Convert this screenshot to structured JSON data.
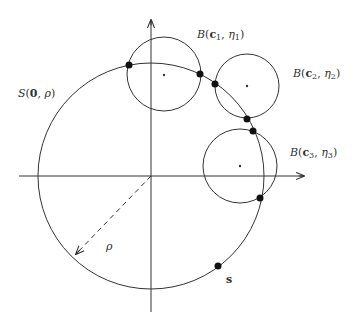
{
  "figure": {
    "labels": {
      "big_sphere": {
        "S": "S",
        "open": "(",
        "center": "0",
        "sep": ", ",
        "radius": "ρ",
        "close": ")"
      },
      "ball1": {
        "B": "B",
        "open": "(",
        "c": "c",
        "ci": "1",
        "sep": ", ",
        "eta": "η",
        "ei": "1",
        "close": ")"
      },
      "ball2": {
        "B": "B",
        "open": "(",
        "c": "c",
        "ci": "2",
        "sep": ", ",
        "eta": "η",
        "ei": "2",
        "close": ")"
      },
      "ball3": {
        "B": "B",
        "open": "(",
        "c": "c",
        "ci": "3",
        "sep": ", ",
        "eta": "η",
        "ei": "3",
        "close": ")"
      },
      "radius": "ρ",
      "point": "s"
    },
    "colors": {
      "stroke": "#333333",
      "background": "#ffffff"
    }
  }
}
